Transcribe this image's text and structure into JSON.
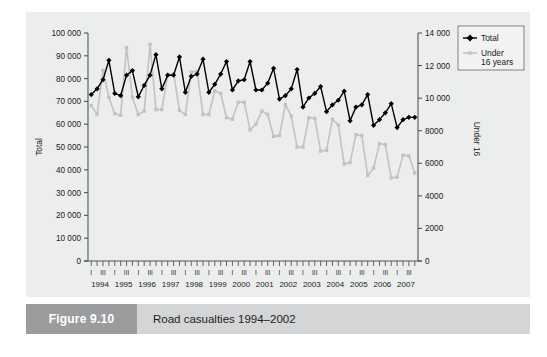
{
  "figure": {
    "number_label": "Figure 9.10",
    "caption": "Road casualties 1994–2002"
  },
  "legend": {
    "position": "top-right",
    "items": [
      {
        "label": "Total",
        "color": "#000000",
        "marker": "diamond"
      },
      {
        "label": "Under\n16 years",
        "label_line1": "Under",
        "label_line2": "16 years",
        "color": "#c2c2c2",
        "marker": "square"
      }
    ]
  },
  "chart_data": {
    "type": "line",
    "title": "Road casualties 1994–2002",
    "xlabel": "",
    "ylabel": "Total",
    "y2label": "Under 16",
    "grid": false,
    "ylim": [
      0,
      100000
    ],
    "y2lim": [
      0,
      14000
    ],
    "yticks": [
      "0",
      "10 000",
      "20 000",
      "30 000",
      "40 000",
      "50 000",
      "60 000",
      "70 000",
      "80 000",
      "90 000",
      "100 000"
    ],
    "ytick_values": [
      0,
      10000,
      20000,
      30000,
      40000,
      50000,
      60000,
      70000,
      80000,
      90000,
      100000
    ],
    "y2ticks": [
      "0",
      "2000",
      "4000",
      "6000",
      "8000",
      "10 000",
      "12 000",
      "14 000"
    ],
    "y2tick_values": [
      0,
      2000,
      4000,
      6000,
      8000,
      10000,
      12000,
      14000
    ],
    "years": [
      "1994",
      "1995",
      "1996",
      "1997",
      "1998",
      "1999",
      "2000",
      "2001",
      "2002",
      "2003",
      "2004",
      "2005",
      "2006",
      "2007"
    ],
    "quarter_labels": [
      "I",
      "",
      "III",
      ""
    ],
    "x": [
      "1994 I",
      "1994 II",
      "1994 III",
      "1994 IV",
      "1995 I",
      "1995 II",
      "1995 III",
      "1995 IV",
      "1996 I",
      "1996 II",
      "1996 III",
      "1996 IV",
      "1997 I",
      "1997 II",
      "1997 III",
      "1997 IV",
      "1998 I",
      "1998 II",
      "1998 III",
      "1998 IV",
      "1999 I",
      "1999 II",
      "1999 III",
      "1999 IV",
      "2000 I",
      "2000 II",
      "2000 III",
      "2000 IV",
      "2001 I",
      "2001 II",
      "2001 III",
      "2001 IV",
      "2002 I",
      "2002 II",
      "2002 III",
      "2002 IV",
      "2003 I",
      "2003 II",
      "2003 III",
      "2003 IV",
      "2004 I",
      "2004 II",
      "2004 III",
      "2004 IV",
      "2005 I",
      "2005 II",
      "2005 III",
      "2005 IV",
      "2006 I",
      "2006 II",
      "2006 III",
      "2006 IV",
      "2007 I",
      "2007 II",
      "2007 III",
      "2007 IV"
    ],
    "series": [
      {
        "name": "Total",
        "axis": "left",
        "color": "#000000",
        "marker": "diamond",
        "values": [
          73000,
          75500,
          79500,
          88000,
          73500,
          72500,
          81500,
          83500,
          72000,
          77000,
          81500,
          90500,
          75500,
          81500,
          81500,
          89500,
          74000,
          81000,
          82000,
          88500,
          74000,
          77500,
          82000,
          87500,
          75000,
          79000,
          79500,
          87500,
          75000,
          75000,
          78000,
          84500,
          71000,
          72500,
          75500,
          84000,
          67500,
          71500,
          73500,
          76500,
          65500,
          68500,
          70500,
          74500,
          61500,
          67500,
          68500,
          73000,
          59500,
          62000,
          65000,
          69000,
          58500,
          62000,
          63000,
          63000
        ]
      },
      {
        "name": "Under 16 years",
        "axis": "right",
        "color": "#c2c2c2",
        "marker": "square",
        "values": [
          9550,
          9000,
          11700,
          10050,
          9050,
          8950,
          13100,
          10050,
          9000,
          9200,
          13300,
          9300,
          9300,
          11450,
          11500,
          9250,
          9000,
          11600,
          11650,
          9000,
          9000,
          10450,
          10300,
          8800,
          8700,
          9750,
          9750,
          8050,
          8400,
          9200,
          9000,
          7650,
          7700,
          9600,
          8900,
          7000,
          7000,
          8800,
          8750,
          6750,
          6800,
          8700,
          8350,
          5950,
          6050,
          7750,
          7700,
          5250,
          5700,
          7200,
          7150,
          5100,
          5150,
          6500,
          6450,
          5400
        ]
      }
    ]
  }
}
